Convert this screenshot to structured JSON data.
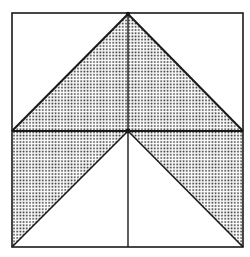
{
  "figure": {
    "colors": {
      "background": "#ffffff",
      "line": "#1a1a1a",
      "dot": "#2a2a2a"
    },
    "square": {
      "x1": 12,
      "y1": 13,
      "x2": 243,
      "y2": 247
    },
    "center": {
      "x": 128,
      "y": 131
    },
    "apex": {
      "x": 128,
      "y": 14
    },
    "shaded_regions": [
      {
        "name": "upper-triangle",
        "points": "12,131 128,14 243,131"
      },
      {
        "name": "lower-left-triangle",
        "points": "12,131 128,131 12,247"
      },
      {
        "name": "lower-right-triangle",
        "points": "128,131 243,131 243,247"
      }
    ]
  }
}
